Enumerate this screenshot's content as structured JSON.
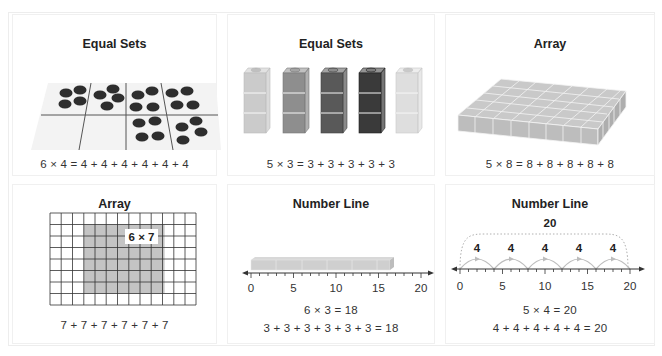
{
  "panels": [
    {
      "id": "equal-sets-counters",
      "title": "Equal Sets",
      "equation": "6 × 4 = 4 + 4 + 4 + 4 + 4 + 4",
      "groups": 6,
      "per_group": 4
    },
    {
      "id": "equal-sets-cubes",
      "title": "Equal Sets",
      "equation": "5 × 3 = 3 + 3 + 3 + 3 + 3",
      "towers": 5,
      "cubes_per_tower": 3,
      "tower_colors": [
        "#c9c9c9",
        "#8e8e8e",
        "#5a5a5a",
        "#3a3a3a",
        "#dcdcdc"
      ]
    },
    {
      "id": "array-slab",
      "title": "Array",
      "equation": "5 × 8 = 8 + 8 + 8 + 8 + 8",
      "rows": 5,
      "columns": 8
    },
    {
      "id": "array-grid",
      "title": "Array",
      "label": "6 × 7",
      "equation": "7 + 7 + 7 + 7 + 7 + 7",
      "grid_columns": 13,
      "grid_rows": 8,
      "shaded_rows": 6,
      "shaded_columns": 7
    },
    {
      "id": "number-line-cubes",
      "title": "Number Line",
      "equation_1": "6 × 3 = 18",
      "equation_2": "3 + 3 + 3 + 3 + 3 + 3 = 18",
      "tick_labels": [
        "0",
        "5",
        "10",
        "15",
        "20"
      ],
      "bar_end": 18
    },
    {
      "id": "number-line-jumps",
      "title": "Number Line",
      "total_label": "20",
      "jump_labels": [
        "4",
        "4",
        "4",
        "4",
        "4"
      ],
      "equation_1": "5 × 4 = 20",
      "equation_2": "4 + 4 + 4 + 4 + 4 = 20",
      "tick_labels": [
        "0",
        "5",
        "10",
        "15",
        "20"
      ]
    }
  ],
  "colors": {
    "counter": "#2e2e2e",
    "tray": "#f2f2f2",
    "shaded": "#c4c4c4",
    "cube_gray": "#cfcfcf",
    "arc": "#bdbdbd"
  }
}
